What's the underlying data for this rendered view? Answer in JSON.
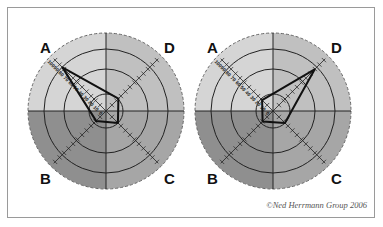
{
  "chart_data": [
    {
      "type": "radar",
      "title": "",
      "axes": [
        "A",
        "B",
        "C",
        "D"
      ],
      "scale_ticks": [
        0,
        10,
        20,
        30,
        40,
        50,
        60,
        70,
        80,
        90,
        100
      ],
      "values": {
        "A": 88,
        "B": 20,
        "C": 24,
        "D": 25
      },
      "quadrant_colors": {
        "A": "#d5d5d5",
        "D": "#c0c0c0",
        "B": "#8f8f8f",
        "C": "#a6a6a6"
      }
    },
    {
      "type": "radar",
      "title": "",
      "axes": [
        "A",
        "B",
        "C",
        "D"
      ],
      "scale_ticks": [
        0,
        10,
        20,
        30,
        40,
        50,
        60,
        70,
        80,
        90,
        100
      ],
      "values": {
        "A": 22,
        "B": 21,
        "C": 24,
        "D": 84
      },
      "quadrant_colors": {
        "A": "#d5d5d5",
        "D": "#c0c0c0",
        "B": "#8f8f8f",
        "C": "#a6a6a6"
      }
    }
  ],
  "labels": {
    "a": "A",
    "b": "B",
    "c": "C",
    "d": "D"
  },
  "scale_labels": [
    "100",
    "90",
    "80",
    "70",
    "60",
    "50",
    "40",
    "30",
    "20",
    "10",
    "0"
  ],
  "copyright": "©Ned Herrmann Group 2006"
}
